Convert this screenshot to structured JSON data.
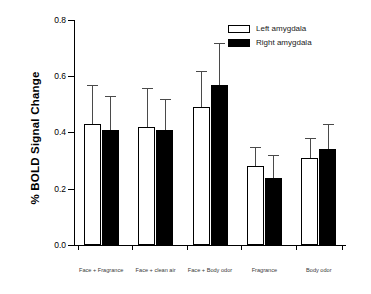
{
  "chart_data": {
    "type": "bar",
    "title": "",
    "xlabel": "",
    "ylabel": "% BOLD Signal Change",
    "ylim": [
      0.0,
      0.8
    ],
    "yticks": [
      "0.0",
      "0.2",
      "0.4",
      "0.6",
      "0.8"
    ],
    "ytick_values": [
      0.0,
      0.2,
      0.4,
      0.6,
      0.8
    ],
    "grid": false,
    "legend_position": "top-right",
    "categories": [
      "Face + Fragrance",
      "Face + clean air",
      "Face + Body odor",
      "Fragrance",
      "Body odor"
    ],
    "series": [
      {
        "name": "Left amygdala",
        "color": "#ffffff",
        "values": [
          0.43,
          0.42,
          0.49,
          0.28,
          0.31
        ],
        "errors": [
          0.14,
          0.14,
          0.13,
          0.07,
          0.07
        ]
      },
      {
        "name": "Right amygdala",
        "color": "#000000",
        "values": [
          0.41,
          0.41,
          0.57,
          0.24,
          0.34
        ],
        "errors": [
          0.12,
          0.11,
          0.15,
          0.08,
          0.09
        ]
      }
    ]
  },
  "legend": {
    "items": [
      {
        "label": "Left amygdala",
        "swatch": "white"
      },
      {
        "label": "Right amygdala",
        "swatch": "black"
      }
    ]
  },
  "axis": {
    "y_title": "% BOLD Signal Change",
    "y_ticks": [
      "0.8",
      "0.6",
      "0.4",
      "0.2",
      "0.0"
    ]
  }
}
